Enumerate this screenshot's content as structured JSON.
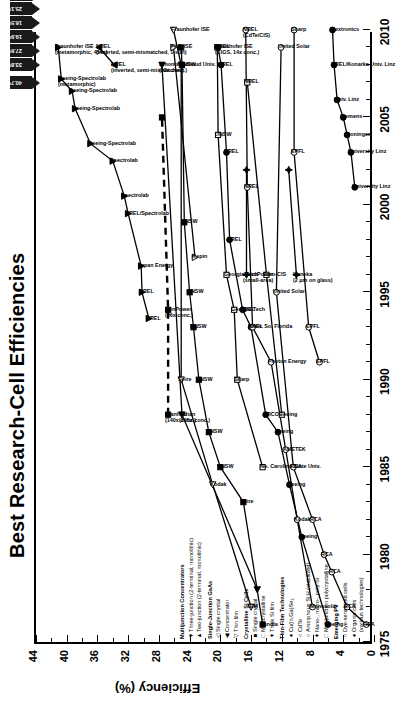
{
  "title": "Best Research-Cell Efficiencies",
  "revision": "Rev. 11-02-07",
  "axes": {
    "ylabel": "Efficiency (%)",
    "yticks": [
      0,
      4,
      8,
      12,
      16,
      20,
      24,
      28,
      32,
      36,
      40,
      44
    ],
    "ylim": [
      0,
      44
    ],
    "xticks": [
      1975,
      1980,
      1985,
      1990,
      1995,
      2000,
      2005,
      2010
    ],
    "xlim": [
      1975,
      2010
    ]
  },
  "legend": [
    {
      "header": "Multijunction Concentrators",
      "items": [
        {
          "glyph": "▼",
          "label": "Three-junction (2-terminal, monolithic)"
        },
        {
          "glyph": "▲",
          "label": "Two-junction (2-terminal, monolithic)"
        }
      ]
    },
    {
      "header": "Single-Junction GaAs",
      "items": [
        {
          "glyph": "◁",
          "label": "Single crystal"
        },
        {
          "glyph": "◀",
          "label": "Concentrator"
        },
        {
          "glyph": "▽",
          "label": "Thin film"
        }
      ]
    },
    {
      "header": "Crystalline Si Cells",
      "items": [
        {
          "glyph": "■",
          "label": "Single crystal"
        },
        {
          "glyph": "□",
          "label": "Multicrystalline"
        },
        {
          "glyph": "✦",
          "label": "Thick Si film"
        }
      ]
    },
    {
      "header": "Thin-Film Technologies",
      "items": [
        {
          "glyph": "●",
          "label": "Cu(In,Ga)Se₂"
        },
        {
          "glyph": "○",
          "label": "CdTe"
        },
        {
          "glyph": "○",
          "label": "Amorphous Si:H (stabilized)"
        },
        {
          "glyph": "✦",
          "label": "Nano-, micro-, poly-Si"
        },
        {
          "glyph": "□",
          "label": "Multijunction polycrystalline"
        }
      ]
    },
    {
      "header": "Emerging PV",
      "items": [
        {
          "glyph": "○",
          "label": "Dye-sensitized cells"
        },
        {
          "glyph": "●",
          "label": "Organic cells"
        },
        {
          "glyph": "",
          "label": "(various technologies)"
        }
      ]
    }
  ],
  "record_flags": [
    {
      "value": "40.7%",
      "year": 2007,
      "eff": 40.7
    },
    {
      "value": "33.8%",
      "year": 2008,
      "eff": 33.8
    },
    {
      "value": "27.6%",
      "year": 2008,
      "eff": 27.6
    },
    {
      "value": "25.1%",
      "year": 2009,
      "eff": 25.1
    },
    {
      "value": "20.3%",
      "year": 2009,
      "eff": 20.3
    },
    {
      "value": "19.9%",
      "year": 2008,
      "eff": 19.9
    },
    {
      "value": "16.5%",
      "year": 2008,
      "eff": 16.5
    },
    {
      "value": "12.1%",
      "year": 2009,
      "eff": 12.1
    },
    {
      "value": "11.1%",
      "year": 2009,
      "eff": 11.1
    },
    {
      "value": "5.4%",
      "year": 2010,
      "eff": 5.4
    }
  ],
  "chart_data": {
    "type": "line",
    "title": "Best Research-Cell Efficiencies",
    "xlabel": "",
    "ylabel": "Efficiency (%)",
    "xlim": [
      1975,
      2010
    ],
    "ylim": [
      0,
      44
    ],
    "grid": false,
    "legend_position": "lower-left-inside",
    "series": [
      {
        "name": "Three-junction concentrator",
        "glyph": "▼",
        "points": [
          {
            "x": 1993.5,
            "y": 29.3,
            "label": "NREL"
          },
          {
            "x": 1995.0,
            "y": 30.2,
            "label": "NREL"
          },
          {
            "x": 1996.5,
            "y": 30.3,
            "label": "Japan Energy"
          },
          {
            "x": 1999.5,
            "y": 32.0,
            "label": "NREL/Spectrolab"
          },
          {
            "x": 2000.5,
            "y": 32.5,
            "label": "Spectrolab"
          },
          {
            "x": 2002.5,
            "y": 34.0,
            "label": "Spectrolab"
          },
          {
            "x": 2003.5,
            "y": 36.9,
            "label": "Boeing-Spectrolab"
          },
          {
            "x": 2005.5,
            "y": 38.9,
            "label": "Boeing-Spectrolab"
          },
          {
            "x": 2006.5,
            "y": 39.3,
            "label": "Boeing-Spectrolab"
          },
          {
            "x": 2007.2,
            "y": 40.7,
            "label": "Boeing-Spectrolab (metamorphic)"
          },
          {
            "x": 2009.0,
            "y": 41.1,
            "label": "Fraunhofer ISE (metamorphic, 454x)"
          }
        ]
      },
      {
        "name": "Two-junction concentrator",
        "glyph": "▲",
        "points": [
          {
            "x": 2008.0,
            "y": 33.8,
            "label": "NREL (inverted, semi-mismatched)"
          },
          {
            "x": 2009.0,
            "y": 35.8,
            "label": "NREL (inverted, semi-mismatched, 1-sun)"
          }
        ]
      },
      {
        "name": "Single-Junction GaAs concentrator",
        "glyph": "◀",
        "points": [
          {
            "x": 1978.0,
            "y": 15.2,
            "label": ""
          },
          {
            "x": 1988.0,
            "y": 25.0,
            "label": "Varian (205x conc.)"
          },
          {
            "x": 2008.0,
            "y": 27.6,
            "label": "Amonix (92x conc.)"
          }
        ]
      },
      {
        "name": "Single-Junction GaAs single crystal",
        "glyph": "◁",
        "points": [
          {
            "x": 1977.0,
            "y": 16.0,
            "label": "IBM"
          },
          {
            "x": 1984.0,
            "y": 21.0,
            "label": "Kodak"
          },
          {
            "x": 1990.0,
            "y": 25.1,
            "label": "Spire"
          },
          {
            "x": 2008.0,
            "y": 25.1,
            "label": "Radboud Univ."
          },
          {
            "x": 2010.0,
            "y": 26.1,
            "label": "Fraunhofer ISE"
          }
        ]
      },
      {
        "name": "Single-Junction GaAs thin film",
        "glyph": "▽",
        "points": [
          {
            "x": 1997.0,
            "y": 23.3,
            "label": "Kopin"
          },
          {
            "x": 2009.0,
            "y": 26.1,
            "label": "FhG-ISE"
          }
        ]
      },
      {
        "name": "Crystalline Si single crystal",
        "glyph": "■",
        "points": [
          {
            "x": 1976.0,
            "y": 14.5,
            "label": "Sandia"
          },
          {
            "x": 1983.0,
            "y": 17.0,
            "label": "Spire"
          },
          {
            "x": 1985.0,
            "y": 20.0,
            "label": "UNSW"
          },
          {
            "x": 1987.0,
            "y": 21.5,
            "label": "UNSW"
          },
          {
            "x": 1990.0,
            "y": 22.8,
            "label": "UNSW"
          },
          {
            "x": 1993.0,
            "y": 23.5,
            "label": "UNSW"
          },
          {
            "x": 1995.0,
            "y": 24.0,
            "label": "UNSW"
          },
          {
            "x": 1999.0,
            "y": 24.7,
            "label": "UNSW"
          },
          {
            "x": 2008.0,
            "y": 25.0,
            "label": "UNSW"
          },
          {
            "x": 2009.0,
            "y": 25.1,
            "label": ""
          }
        ]
      },
      {
        "name": "Crystalline Si concentrator (Si)",
        "glyph": "■",
        "points": [
          {
            "x": 1988.0,
            "y": 26.8,
            "label": "Stanford (140x conc.)"
          },
          {
            "x": 1994.0,
            "y": 26.8,
            "label": "SunPower (96x conc.)"
          },
          {
            "x": 2005.0,
            "y": 27.6,
            "label": ""
          }
        ]
      },
      {
        "name": "Crystalline Si multicrystalline",
        "glyph": "□",
        "points": [
          {
            "x": 1985.0,
            "y": 14.5,
            "label": "No. Carolina State Univ."
          },
          {
            "x": 1990.0,
            "y": 17.8,
            "label": "Sharp"
          },
          {
            "x": 1994.0,
            "y": 18.2,
            "label": "Georgia Tech"
          },
          {
            "x": 1996.0,
            "y": 19.2,
            "label": "Georgia Tech"
          },
          {
            "x": 2004.0,
            "y": 20.3,
            "label": "UNSW"
          },
          {
            "x": 2009.0,
            "y": 20.4,
            "label": "Fraunhofer ISE"
          }
        ]
      },
      {
        "name": "Thick Si film",
        "glyph": "✦",
        "points": [
          {
            "x": 1996.0,
            "y": 16.6,
            "label": "AstroPower (small-area)"
          },
          {
            "x": 2002.0,
            "y": 16.6,
            "label": ""
          }
        ]
      },
      {
        "name": "Cu(In,Ga)Se2",
        "glyph": "●",
        "points": [
          {
            "x": 1976.0,
            "y": 6.0,
            "label": "Boeing"
          },
          {
            "x": 1981.0,
            "y": 9.4,
            "label": "Boeing"
          },
          {
            "x": 1984.0,
            "y": 11.0,
            "label": "Boeing"
          },
          {
            "x": 1987.0,
            "y": 12.5,
            "label": "Boeing"
          },
          {
            "x": 1988.0,
            "y": 14.1,
            "label": "ARCO"
          },
          {
            "x": 1993.0,
            "y": 16.0,
            "label": "NREL"
          },
          {
            "x": 1994.0,
            "y": 17.1,
            "label": "NREL"
          },
          {
            "x": 1998.0,
            "y": 18.8,
            "label": "NREL"
          },
          {
            "x": 2003.0,
            "y": 19.2,
            "label": "NREL"
          },
          {
            "x": 2008.0,
            "y": 19.9,
            "label": "NREL"
          },
          {
            "x": 2009.0,
            "y": 20.3,
            "label": "NREL (CIGS, 14x conc.)"
          }
        ]
      },
      {
        "name": "CdTe",
        "glyph": "○",
        "points": [
          {
            "x": 1977.0,
            "y": 8.0,
            "label": "Monosolar"
          },
          {
            "x": 1982.0,
            "y": 10.0,
            "label": "Kodak"
          },
          {
            "x": 1986.0,
            "y": 11.5,
            "label": "AMETEK"
          },
          {
            "x": 1991.0,
            "y": 13.4,
            "label": "Photon Energy"
          },
          {
            "x": 1993.0,
            "y": 15.8,
            "label": "Univ. So. Florida"
          },
          {
            "x": 2001.0,
            "y": 16.5,
            "label": "NREL"
          },
          {
            "x": 2010.0,
            "y": 16.7,
            "label": "NREL (CdTe/CIS)"
          }
        ]
      },
      {
        "name": "Amorphous Si:H (stabilized)",
        "glyph": "○",
        "points": [
          {
            "x": 1976.0,
            "y": 1.0,
            "label": "RCA"
          },
          {
            "x": 1977.0,
            "y": 3.5,
            "label": "RCA"
          },
          {
            "x": 1979.0,
            "y": 5.5,
            "label": "RCA"
          },
          {
            "x": 1980.0,
            "y": 6.5,
            "label": "RCA"
          },
          {
            "x": 1982.0,
            "y": 8.0,
            "label": "RCA"
          },
          {
            "x": 1985.0,
            "y": 10.5,
            "label": "RCA"
          },
          {
            "x": 1995.0,
            "y": 12.7,
            "label": "United Solar"
          },
          {
            "x": 2009.0,
            "y": 12.1,
            "label": "United Solar"
          }
        ]
      },
      {
        "name": "Nano-, micro-, poly-Si",
        "glyph": "✦",
        "points": [
          {
            "x": 1996.0,
            "y": 10.1,
            "label": "Kaneka (2 μm on glass)"
          },
          {
            "x": 2002.0,
            "y": 11.1,
            "label": ""
          }
        ]
      },
      {
        "name": "Multijunction polycrystalline",
        "glyph": "□",
        "points": [
          {
            "x": 1988.0,
            "y": 12.0,
            "label": "Boeing"
          },
          {
            "x": 1996.0,
            "y": 14.0,
            "label": "Euro-CIS"
          },
          {
            "x": 2007.0,
            "y": 16.5,
            "label": "NREL"
          }
        ]
      },
      {
        "name": "Dye-sensitized cells",
        "glyph": "○",
        "points": [
          {
            "x": 1991.0,
            "y": 7.1,
            "label": "EPFL"
          },
          {
            "x": 1993.0,
            "y": 8.5,
            "label": "EPFL"
          },
          {
            "x": 2003.0,
            "y": 10.4,
            "label": "EPFL"
          },
          {
            "x": 2010.0,
            "y": 10.4,
            "label": "Sharp"
          }
        ]
      },
      {
        "name": "Organic cells (various technologies)",
        "glyph": "●",
        "points": [
          {
            "x": 2001.0,
            "y": 2.5,
            "label": "University Linz"
          },
          {
            "x": 2003.0,
            "y": 3.0,
            "label": "University Linz"
          },
          {
            "x": 2004.0,
            "y": 3.5,
            "label": "Groningen"
          },
          {
            "x": 2005.0,
            "y": 4.0,
            "label": "Siemens"
          },
          {
            "x": 2006.0,
            "y": 4.8,
            "label": "Univ. Linz"
          },
          {
            "x": 2008.0,
            "y": 5.2,
            "label": "NREL/Konarka Univ. Linz"
          },
          {
            "x": 2010.0,
            "y": 5.4,
            "label": "Plextronics"
          }
        ]
      }
    ],
    "annotations": [
      "Boeing-Spectrolab (metamorphic)",
      "NREL (inverted, semi-mismatched)",
      "NREL (inverted, Lattice mismatched, 1-sun)",
      "Spectrolab",
      "NREL/Spectrolab",
      "Japan Energy",
      "NREL",
      "Amonix (92x conc.)",
      "FhG-ISE",
      "SunPower (96x conc.)",
      "Stanford (140x conc.)",
      "Varian (205x conc.)",
      "UNSW",
      "Kopin",
      "Spire",
      "Georgia Tech",
      "Sharp",
      "No. Carolina State Univ.",
      "Westinghouse",
      "ARCO",
      "Univ. So. Florida",
      "Photon Energy",
      "AMETEK",
      "Monosolar",
      "Kodak",
      "Boeing",
      "RCA",
      "University of Maine",
      "Matsushita",
      "EPFL",
      "United Solar",
      "Euro-CIS",
      "AstroPower (small-area)",
      "Kaneka (2 μm on glass)",
      "NREL (CdTe/CIS)",
      "NREL CuIn,Ga)Se2 (14x conc.)",
      "Univ. Stuttgart (45 μm thin-film transfer)",
      "Groningen",
      "Siemens",
      "University Linz",
      "NREL/Konarka Univ. Linz",
      "Plextronics",
      "Sharp"
    ]
  }
}
